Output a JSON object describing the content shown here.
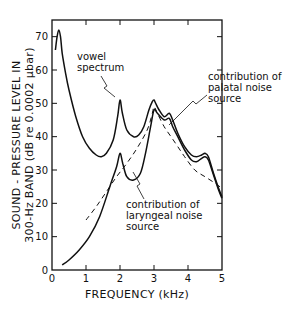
{
  "chart_data": {
    "type": "line",
    "title": "",
    "xlabel": "FREQUENCY  (kHz)",
    "ylabel_lines": [
      "SOUND - PRESSURE LEVEL IN",
      "300-Hz BAND  (dB  re 0.0002 μbar)"
    ],
    "xlim": [
      0,
      5
    ],
    "ylim": [
      0,
      75
    ],
    "x_ticks": [
      0,
      1,
      2,
      3,
      4,
      5
    ],
    "x_tick_labels": [
      "0",
      "1",
      "2",
      "3",
      "4",
      "5"
    ],
    "y_ticks": [
      0,
      10,
      20,
      30,
      40,
      50,
      60,
      70
    ],
    "y_tick_labels": [
      "0",
      "10",
      "20",
      "30",
      "40",
      "50",
      "60",
      "70"
    ],
    "grid": false,
    "series": [
      {
        "name": "vowel spectrum",
        "style": "solid",
        "x": [
          0.1,
          0.15,
          0.2,
          0.25,
          0.3,
          0.4,
          0.5,
          0.7,
          0.9,
          1.1,
          1.3,
          1.45,
          1.6,
          1.8,
          1.93,
          2.0,
          2.07,
          2.2,
          2.4,
          2.55,
          2.7,
          2.85,
          2.95,
          3.0,
          3.05,
          3.15,
          3.3,
          3.45,
          3.55,
          3.7,
          3.9,
          4.1,
          4.25,
          4.4,
          4.5,
          4.6,
          4.75,
          4.9,
          5.0
        ],
        "y": [
          66,
          70,
          72,
          70,
          65,
          59,
          54,
          46,
          40,
          36.5,
          34.5,
          34,
          35,
          39,
          46,
          51,
          47,
          42,
          40,
          40.5,
          43,
          48,
          50.5,
          51,
          50,
          48,
          46,
          47,
          45,
          41,
          37,
          34.5,
          34,
          34.5,
          35,
          34,
          29,
          24.5,
          22
        ]
      },
      {
        "name": "contribution of laryngeal noise source",
        "style": "solid",
        "x": [
          0.3,
          0.5,
          0.8,
          1.1,
          1.4,
          1.7,
          1.9,
          2.0,
          2.08,
          2.2,
          2.4,
          2.6,
          2.75,
          2.9,
          3.0,
          3.1,
          3.3,
          3.45,
          3.55,
          3.7,
          3.9,
          4.1,
          4.25,
          4.4,
          4.5,
          4.6,
          4.75,
          4.9,
          5.0
        ],
        "y": [
          1.5,
          3,
          6,
          10,
          16,
          25,
          31,
          35,
          32,
          28,
          27,
          29,
          35,
          43,
          48,
          47,
          45,
          45.5,
          43,
          40,
          36,
          33,
          32.5,
          33.5,
          34,
          33,
          28.5,
          24,
          21.5
        ]
      },
      {
        "name": "contribution of palatal noise source",
        "style": "dashed",
        "x": [
          1.0,
          1.3,
          1.6,
          1.9,
          2.2,
          2.5,
          2.8,
          2.95,
          3.0,
          3.1,
          3.3,
          3.5,
          3.7,
          3.9,
          4.2,
          4.5,
          4.8,
          5.0
        ],
        "y": [
          15,
          19,
          23.5,
          28,
          32,
          36.5,
          42,
          47,
          49,
          47,
          43,
          40,
          37,
          34,
          30,
          28,
          26,
          24.5
        ]
      }
    ],
    "annotations": [
      {
        "text_lines": [
          "vowel",
          "spectrum"
        ],
        "points_to": "vowel spectrum peak at 2 kHz"
      },
      {
        "text_lines": [
          "contribution of",
          "palatal noise",
          "source"
        ],
        "points_to": "palatal dashed curve near 3.4 kHz"
      },
      {
        "text_lines": [
          "contribution of",
          "laryngeal noise",
          "source"
        ],
        "points_to": "laryngeal curve near 2.6 kHz"
      }
    ],
    "legend": "none"
  }
}
